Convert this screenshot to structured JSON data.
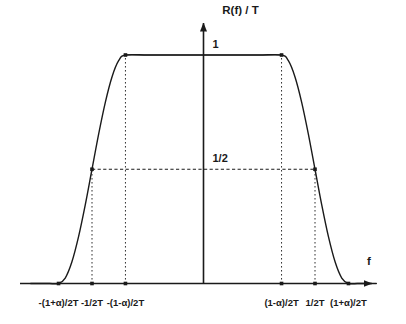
{
  "figure": {
    "axis_color": "#1a1a1a",
    "curve_color": "#1a1a1a",
    "guide_color": "#1a1a1a",
    "background": "#ffffff",
    "y_axis_title": "R(f) / T",
    "x_axis_title": "f",
    "y_labels": {
      "one": "1",
      "half": "1/2"
    }
  },
  "chart_data": {
    "type": "line",
    "title": "",
    "xlabel": "f",
    "ylabel": "R(f) / T",
    "grid": false,
    "legend": null,
    "xlim": [
      -1.55,
      1.55
    ],
    "ylim": [
      0,
      1.18
    ],
    "yticks": [
      0.5,
      1
    ],
    "ytick_labels": [
      "1/2",
      "1"
    ],
    "xticks": [
      -1.3,
      -1.0,
      -0.7,
      0.7,
      1.0,
      1.3
    ],
    "xtick_labels": [
      "-(1+α)/2T",
      "-1/2T",
      "-(1-α)/2T",
      "(1-α)/2T",
      "1/2T",
      "(1+α)/2T"
    ],
    "markers_x": [
      -1.3,
      -1.0,
      -0.7,
      0.7,
      1.0,
      1.3
    ],
    "plateau_marker_x": [
      -0.7,
      0.7
    ],
    "plateau_marker_y": [
      1,
      1
    ],
    "half_marker_x": [
      -1.0,
      1.0
    ],
    "half_marker_y": [
      0.5,
      0.5
    ],
    "rolloff_alpha": 0.3,
    "series": [
      {
        "name": "R(f)/T",
        "x": [
          -1.55,
          -1.45,
          -1.38,
          -1.3,
          -1.24,
          -1.18,
          -1.12,
          -1.06,
          -1.0,
          -0.94,
          -0.88,
          -0.82,
          -0.76,
          -0.7,
          -0.5,
          -0.25,
          0,
          0.25,
          0.5,
          0.7,
          0.76,
          0.82,
          0.88,
          0.94,
          1.0,
          1.06,
          1.12,
          1.18,
          1.24,
          1.3,
          1.38,
          1.45,
          1.55
        ],
        "y": [
          0,
          0,
          0,
          0,
          0.024,
          0.095,
          0.206,
          0.345,
          0.5,
          0.655,
          0.794,
          0.905,
          0.976,
          1,
          1,
          1,
          1,
          1,
          1,
          1,
          0.976,
          0.905,
          0.794,
          0.655,
          0.5,
          0.345,
          0.206,
          0.095,
          0.024,
          0,
          0,
          0,
          0
        ]
      }
    ],
    "guides": {
      "horizontal": [
        {
          "y": 0.5,
          "x_from": -1.0,
          "x_to": 1.0,
          "style": "dashed"
        }
      ],
      "vertical": [
        {
          "x": -1.0,
          "y_from": 0,
          "y_to": 0.5,
          "style": "dotted"
        },
        {
          "x": 1.0,
          "y_from": 0,
          "y_to": 0.5,
          "style": "dotted"
        },
        {
          "x": -0.7,
          "y_from": 0,
          "y_to": 1,
          "style": "dotted"
        },
        {
          "x": 0.7,
          "y_from": 0,
          "y_to": 1,
          "style": "dotted"
        }
      ],
      "plateau_line": {
        "y": 1,
        "x_from": -0.7,
        "x_to": 0.7,
        "style": "solid"
      }
    }
  }
}
